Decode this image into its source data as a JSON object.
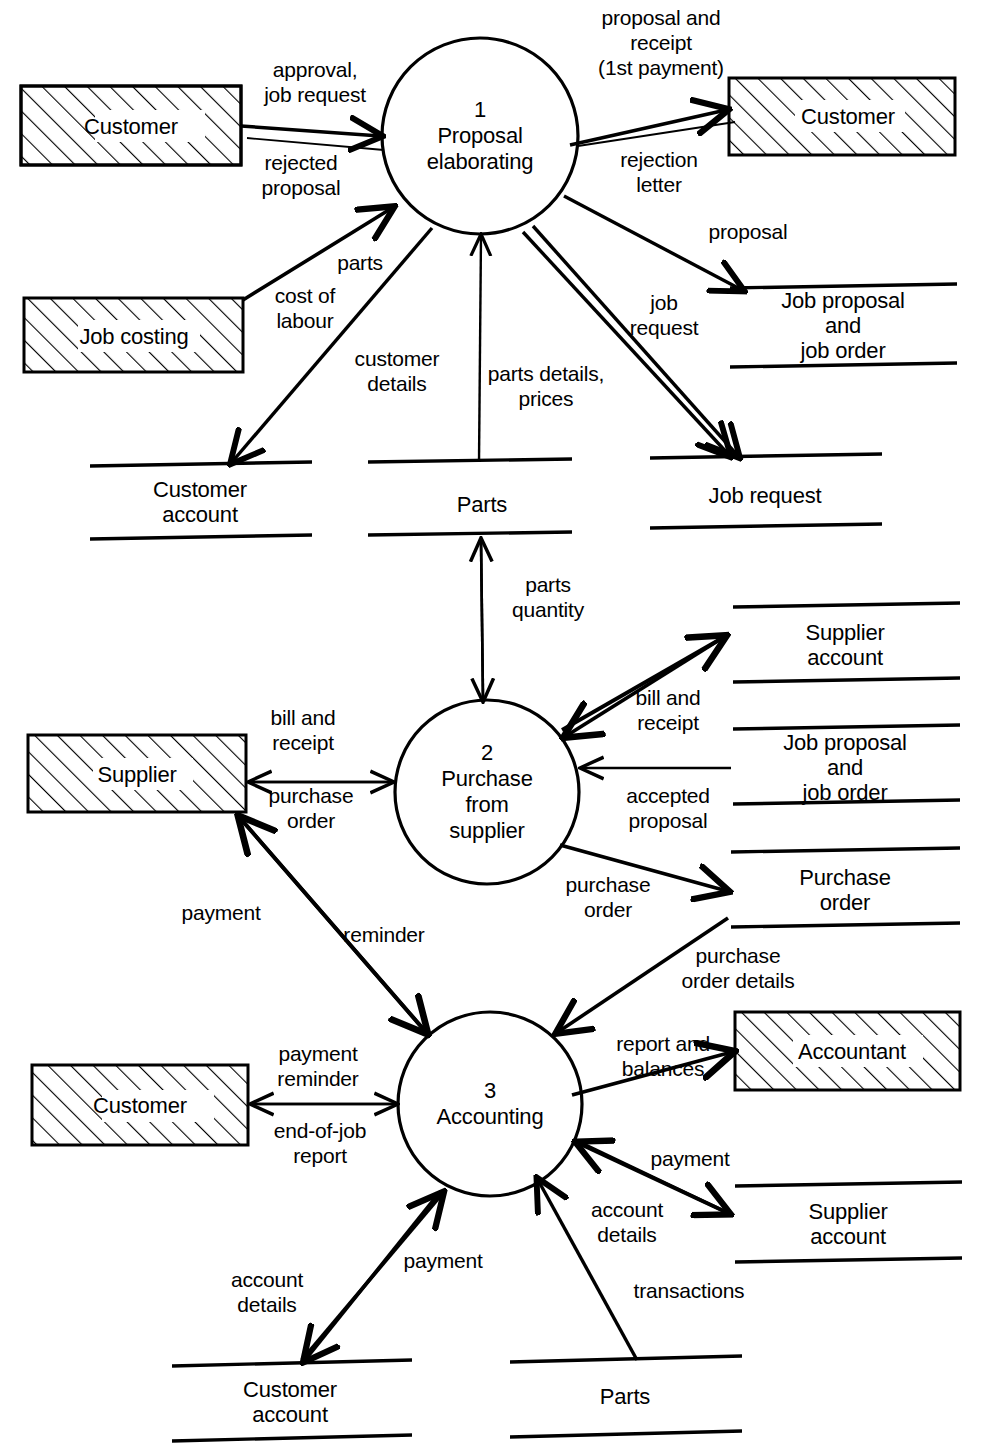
{
  "diagram": {
    "type": "data-flow-diagram",
    "stroke_color": "#000000",
    "background_color": "#ffffff"
  },
  "processes": [
    {
      "number": "1",
      "name": "Proposal\nelaborating",
      "label": "1\nProposal\nelaborating",
      "cx": 480,
      "cy": 136,
      "r": 98
    },
    {
      "number": "2",
      "name": "Purchase\nfrom\nsupplier",
      "label": "2\nPurchase\nfrom\nsupplier",
      "cx": 487,
      "cy": 792,
      "r": 92
    },
    {
      "number": "3",
      "name": "Accounting",
      "label": "3\nAccounting",
      "cx": 490,
      "cy": 1104,
      "r": 92
    }
  ],
  "entities": [
    {
      "label": "Customer",
      "x": 21,
      "y": 86,
      "w": 220,
      "h": 79
    },
    {
      "label": "Customer",
      "x": 729,
      "y": 78,
      "w": 226,
      "h": 77
    },
    {
      "label": "Job costing",
      "x": 24,
      "y": 298,
      "w": 219,
      "h": 74
    },
    {
      "label": "Supplier",
      "x": 28,
      "y": 735,
      "w": 218,
      "h": 77
    },
    {
      "label": "Customer",
      "x": 32,
      "y": 1065,
      "w": 216,
      "h": 80
    },
    {
      "label": "Accountant",
      "x": 735,
      "y": 1012,
      "w": 225,
      "h": 78
    }
  ],
  "data_stores": [
    {
      "label": "Job proposal and\njob order",
      "x1": 730,
      "x2": 957,
      "top": 288,
      "bottom": 365
    },
    {
      "label": "Customer\naccount",
      "x1": 90,
      "x2": 312,
      "top": 464,
      "bottom": 537
    },
    {
      "label": "Parts",
      "x1": 368,
      "x2": 572,
      "top": 460,
      "bottom": 533
    },
    {
      "label": "Job request",
      "x1": 650,
      "x2": 882,
      "top": 456,
      "bottom": 525
    },
    {
      "label": "Supplier\naccount",
      "x1": 733,
      "x2": 960,
      "top": 605,
      "bottom": 680
    },
    {
      "label": "Job proposal and\njob order",
      "x1": 733,
      "x2": 960,
      "top": 727,
      "bottom": 802
    },
    {
      "label": "Purchase\norder",
      "x1": 731,
      "x2": 960,
      "top": 850,
      "bottom": 925
    },
    {
      "label": "Supplier\naccount",
      "x1": 735,
      "x2": 962,
      "top": 1184,
      "bottom": 1260
    },
    {
      "label": "Customer\naccount",
      "x1": 172,
      "x2": 412,
      "top": 1362,
      "bottom": 1437
    },
    {
      "label": "Parts",
      "x1": 510,
      "x2": 742,
      "top": 1358,
      "bottom": 1433
    }
  ],
  "flow_labels": [
    {
      "text": "approval,\njob request",
      "x": 315,
      "y": 82
    },
    {
      "text": "rejected\nproposal",
      "x": 301,
      "y": 175
    },
    {
      "text": "proposal and\nreceipt\n(1st payment)",
      "x": 661,
      "y": 42
    },
    {
      "text": "rejection\nletter",
      "x": 659,
      "y": 172
    },
    {
      "text": "proposal",
      "x": 748,
      "y": 231
    },
    {
      "text": "job\nrequest",
      "x": 664,
      "y": 315
    },
    {
      "text": "parts",
      "x": 360,
      "y": 262
    },
    {
      "text": "cost of\nlabour",
      "x": 305,
      "y": 308
    },
    {
      "text": "customer\ndetails",
      "x": 397,
      "y": 371
    },
    {
      "text": "parts details,\nprices",
      "x": 546,
      "y": 386
    },
    {
      "text": "parts\nquantity",
      "x": 548,
      "y": 597
    },
    {
      "text": "bill and\nreceipt",
      "x": 668,
      "y": 710
    },
    {
      "text": "bill and\nreceipt",
      "x": 303,
      "y": 730
    },
    {
      "text": "purchase\norder",
      "x": 311,
      "y": 808
    },
    {
      "text": "accepted\nproposal",
      "x": 668,
      "y": 808
    },
    {
      "text": "purchase\norder",
      "x": 608,
      "y": 897
    },
    {
      "text": "purchase\norder details",
      "x": 738,
      "y": 968
    },
    {
      "text": "payment",
      "x": 221,
      "y": 912
    },
    {
      "text": "reminder",
      "x": 384,
      "y": 934
    },
    {
      "text": "report and\nbalances",
      "x": 663,
      "y": 1056
    },
    {
      "text": "payment\nreminder",
      "x": 318,
      "y": 1066
    },
    {
      "text": "end-of-job\nreport",
      "x": 320,
      "y": 1143
    },
    {
      "text": "payment",
      "x": 690,
      "y": 1158
    },
    {
      "text": "account\ndetails",
      "x": 627,
      "y": 1222
    },
    {
      "text": "payment",
      "x": 443,
      "y": 1260
    },
    {
      "text": "account\ndetails",
      "x": 267,
      "y": 1292
    },
    {
      "text": "transactions",
      "x": 689,
      "y": 1290
    }
  ],
  "flows": [
    {
      "from": "Customer",
      "to": "1 Proposal elaborating",
      "label": "approval, job request"
    },
    {
      "from": "1 Proposal elaborating",
      "to": "Customer",
      "label": "rejected proposal"
    },
    {
      "from": "1 Proposal elaborating",
      "to": "Customer",
      "label": "proposal and receipt (1st payment)"
    },
    {
      "from": "1 Proposal elaborating",
      "to": "Customer",
      "label": "rejection letter"
    },
    {
      "from": "1 Proposal elaborating",
      "to": "Job proposal and job order",
      "label": "proposal"
    },
    {
      "from": "1 Proposal elaborating",
      "to": "Job request",
      "label": "job request"
    },
    {
      "from": "Job costing",
      "to": "1 Proposal elaborating",
      "label": "parts cost of labour"
    },
    {
      "from": "1 Proposal elaborating",
      "to": "Customer account",
      "label": "customer details"
    },
    {
      "from": "Parts",
      "to": "1 Proposal elaborating",
      "label": "parts details, prices"
    },
    {
      "from": "2 Purchase from supplier",
      "to": "Parts",
      "label": "parts quantity"
    },
    {
      "from": "2 Purchase from supplier",
      "to": "Supplier account",
      "label": "bill and receipt"
    },
    {
      "from": "Supplier",
      "to": "2 Purchase from supplier",
      "label": "bill and receipt"
    },
    {
      "from": "2 Purchase from supplier",
      "to": "Supplier",
      "label": "purchase order"
    },
    {
      "from": "Job proposal and job order",
      "to": "2 Purchase from supplier",
      "label": "accepted proposal"
    },
    {
      "from": "2 Purchase from supplier",
      "to": "Purchase order",
      "label": "purchase order"
    },
    {
      "from": "Purchase order",
      "to": "3 Accounting",
      "label": "purchase order details"
    },
    {
      "from": "3 Accounting",
      "to": "Supplier",
      "label": "payment reminder"
    },
    {
      "from": "3 Accounting",
      "to": "Accountant",
      "label": "report and balances"
    },
    {
      "from": "3 Accounting",
      "to": "Customer",
      "label": "payment reminder"
    },
    {
      "from": "Customer",
      "to": "3 Accounting",
      "label": "end-of-job report"
    },
    {
      "from": "3 Accounting",
      "to": "Supplier account",
      "label": "payment"
    },
    {
      "from": "3 Accounting",
      "to": "Customer account",
      "label": "account details"
    },
    {
      "from": "Customer account",
      "to": "3 Accounting",
      "label": "payment"
    },
    {
      "from": "Parts",
      "to": "3 Accounting",
      "label": "transactions"
    }
  ]
}
